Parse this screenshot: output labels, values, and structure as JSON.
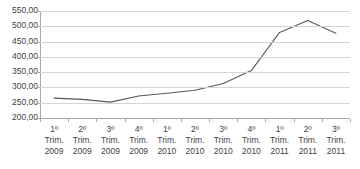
{
  "chart_data": {
    "type": "line",
    "title": "",
    "subtitle": "",
    "xlabel": "",
    "ylabel": "",
    "categories": [
      "1º Trim. 2009",
      "2º Trim. 2009",
      "3º Trim. 2009",
      "4º Trim. 2009",
      "1º Trim. 2010",
      "2º Trim. 2010",
      "3º Trim. 2010",
      "4º Trim. 2010",
      "1º Trim. 2011",
      "2º Trim. 2011",
      "3º Trim. 2011"
    ],
    "category_lines": [
      [
        "1º",
        "Trim.",
        "2009"
      ],
      [
        "2º",
        "Trim.",
        "2009"
      ],
      [
        "3º",
        "Trim.",
        "2009"
      ],
      [
        "4º",
        "Trim.",
        "2009"
      ],
      [
        "1º",
        "Trim.",
        "2010"
      ],
      [
        "2º",
        "Trim.",
        "2010"
      ],
      [
        "3º",
        "Trim.",
        "2010"
      ],
      [
        "4º",
        "Trim.",
        "2010"
      ],
      [
        "1º",
        "Trim.",
        "2011"
      ],
      [
        "2º",
        "Trim.",
        "2011"
      ],
      [
        "3º",
        "Trim.",
        "2011"
      ]
    ],
    "values": [
      265,
      261,
      252,
      272,
      281,
      291,
      313,
      355,
      480,
      519,
      477
    ],
    "ylim": [
      200,
      550
    ],
    "ytick_values": [
      550,
      500,
      450,
      400,
      350,
      300,
      250,
      200
    ],
    "ytick_labels": [
      "550,00",
      "500,00",
      "450,00",
      "400,00",
      "350,00",
      "300,00",
      "250,00",
      "200,00"
    ],
    "grid": true,
    "legend": false,
    "legend_position": "none",
    "markers": false,
    "series_color": "#595959",
    "gridline_color": "#d4d4d4",
    "axis_color": "#a9a9a9",
    "text_color": "#3f3f3f"
  }
}
